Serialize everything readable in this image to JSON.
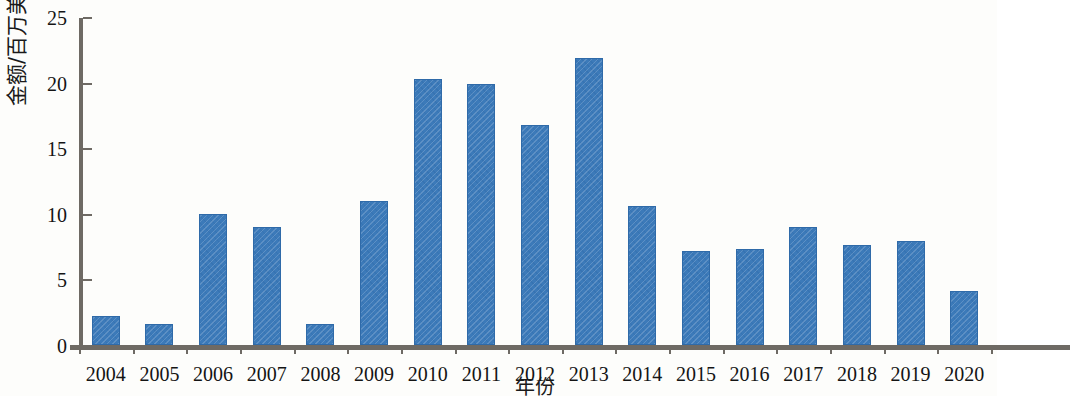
{
  "chart_data": {
    "type": "bar",
    "title": "",
    "xlabel": "年份",
    "ylabel": "金额/百万美元",
    "categories": [
      "2004",
      "2005",
      "2006",
      "2007",
      "2008",
      "2009",
      "2010",
      "2011",
      "2012",
      "2013",
      "2014",
      "2015",
      "2016",
      "2017",
      "2018",
      "2019",
      "2020"
    ],
    "values": [
      2.2,
      1.6,
      10.0,
      9.0,
      1.6,
      11.0,
      20.3,
      19.9,
      16.8,
      21.9,
      10.6,
      7.2,
      7.3,
      9.0,
      7.6,
      7.9,
      4.1
    ],
    "series": [
      {
        "name": "金额",
        "values": [
          2.2,
          1.6,
          10.0,
          9.0,
          1.6,
          11.0,
          20.3,
          19.9,
          16.8,
          21.9,
          10.6,
          7.2,
          7.3,
          9.0,
          7.6,
          7.9,
          4.1
        ]
      }
    ],
    "ylim": [
      0,
      25
    ],
    "yticks": [
      0,
      5,
      10,
      15,
      20,
      25
    ],
    "ytick_labels": [
      "0",
      "5",
      "10",
      "15",
      "20",
      "25"
    ],
    "grid": false,
    "legend": false,
    "legend_position": "none",
    "bar_color": "#3c7ab9",
    "bar_edge_color": "#2f6aa8",
    "axis_color": "#6e6a64",
    "background_color": "#fdfdfb",
    "bar_pattern": "diagonal-hatch"
  }
}
